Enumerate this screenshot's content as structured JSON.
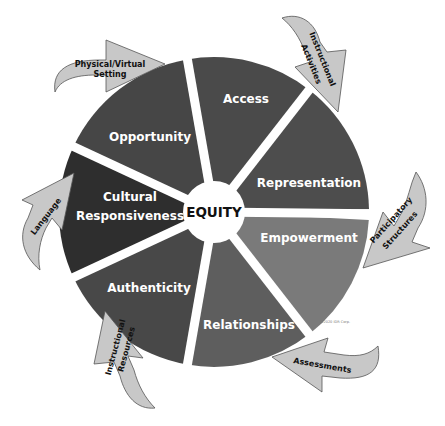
{
  "diagram": {
    "center": {
      "label": "EQUITY"
    },
    "segments": [
      {
        "label": "Access",
        "color": "#4a4a4a"
      },
      {
        "label": "Representation",
        "color": "#4d4d4d"
      },
      {
        "label": "Empowerment",
        "color": "#7a7a7a"
      },
      {
        "label": "Relationships",
        "color": "#5e5e5e"
      },
      {
        "label": "Authenticity",
        "color": "#484848"
      },
      {
        "label": "Cultural",
        "label2": "Responsiveness",
        "color": "#2e2e2e"
      },
      {
        "label": "Opportunity",
        "color": "#464646"
      }
    ],
    "arrows": [
      {
        "label": "Physical/Virtual",
        "label2": "Setting"
      },
      {
        "label": "Instructional",
        "label2": "Activities"
      },
      {
        "label": "Participatory",
        "label2": "Structures"
      },
      {
        "label": "Assessments"
      },
      {
        "label": "Instructional",
        "label2": "Resources"
      },
      {
        "label": "Language"
      }
    ],
    "copyright": "©2020 IDR Corp."
  }
}
